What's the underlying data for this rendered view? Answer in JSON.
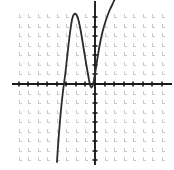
{
  "figure": {
    "name": "cubic-polynomial-graph",
    "background_color": "#ffffff",
    "width": 174,
    "height": 170
  },
  "chart_data": {
    "type": "line",
    "title": "",
    "subtitle": "",
    "xlabel": "",
    "ylabel": "",
    "grid": true,
    "grid_style": "dotted-cross",
    "grid_color": "#c9c9c9",
    "grid_spacing_px": 9.55,
    "legend": "none",
    "annotations": [],
    "axis": {
      "color": "#1a1a1a",
      "x_axis_y_px": 84,
      "y_axis_x_px": 95,
      "tick_color": "#1a1a1a",
      "tick_length_px": 5,
      "tick_spacing_px": 9.55,
      "x_tick_labels": [],
      "y_tick_labels": [],
      "xlim": [
        -8.6,
        7.4
      ],
      "ylim": [
        -8.0,
        7.7
      ]
    },
    "plot_area": {
      "left_px": 13,
      "right_px": 166,
      "top_px": 10,
      "bottom_px": 160
    },
    "series": [
      {
        "name": "curve",
        "color": "#2b2b2b",
        "line_width_px": 1.8,
        "description": "cubic with local maximum and local minimum",
        "key_points": {
          "x_intercepts": [
            -3.15,
            -0.5
          ],
          "local_maximum": [
            -2.4,
            7.3
          ],
          "local_minimum": [
            -0.5,
            -0.3
          ]
        },
        "points_px": [
          [
            57.0,
            162.0
          ],
          [
            57.6,
            152.0
          ],
          [
            58.3,
            142.0
          ],
          [
            59.1,
            132.0
          ],
          [
            59.9,
            122.0
          ],
          [
            60.8,
            112.0
          ],
          [
            61.8,
            102.0
          ],
          [
            62.9,
            92.0
          ],
          [
            64.2,
            82.0
          ],
          [
            65.0,
            76.0
          ],
          [
            65.7,
            70.0
          ],
          [
            66.6,
            62.0
          ],
          [
            67.6,
            53.0
          ],
          [
            68.6,
            44.0
          ],
          [
            69.7,
            35.0
          ],
          [
            70.8,
            27.0
          ],
          [
            71.9,
            20.0
          ],
          [
            73.2,
            15.5
          ],
          [
            74.6,
            13.6
          ],
          [
            76.0,
            14.0
          ],
          [
            77.4,
            16.6
          ],
          [
            78.7,
            21.0
          ],
          [
            80.0,
            27.0
          ],
          [
            81.3,
            34.0
          ],
          [
            82.6,
            42.0
          ],
          [
            83.9,
            50.0
          ],
          [
            85.2,
            58.0
          ],
          [
            86.5,
            66.0
          ],
          [
            87.8,
            73.0
          ],
          [
            89.0,
            80.0
          ],
          [
            90.2,
            85.5
          ],
          [
            91.4,
            87.5
          ],
          [
            92.6,
            86.0
          ],
          [
            93.8,
            81.0
          ],
          [
            95.0,
            74.0
          ],
          [
            96.4,
            65.0
          ],
          [
            97.8,
            56.0
          ],
          [
            99.3,
            47.0
          ],
          [
            100.9,
            39.0
          ],
          [
            102.6,
            31.5
          ],
          [
            104.4,
            25.0
          ],
          [
            106.3,
            19.0
          ],
          [
            108.3,
            13.5
          ],
          [
            110.4,
            8.5
          ],
          [
            112.6,
            4.0
          ],
          [
            114.4,
            0.0
          ]
        ]
      }
    ]
  }
}
